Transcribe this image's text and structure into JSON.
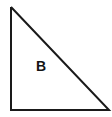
{
  "figure": {
    "kind": "geometry-figure",
    "shape_type": "right-triangle",
    "background_color": "#ffffff",
    "stroke_color": "#1a1a1a",
    "stroke_width": 2,
    "fill": "none",
    "canvas": {
      "width": 112,
      "height": 117
    },
    "label": {
      "text": "B",
      "x": 41,
      "y": 67,
      "color": "#141414",
      "bold": true,
      "font_size": 14
    },
    "vertices": [
      {
        "name": "top-left-apex",
        "x": 11,
        "y": 7
      },
      {
        "name": "bottom-left-right-angle",
        "x": 11,
        "y": 110
      },
      {
        "name": "bottom-right",
        "x": 109,
        "y": 110
      }
    ],
    "edges": [
      {
        "name": "vertical-leg",
        "from": "top-left-apex",
        "to": "bottom-left-right-angle"
      },
      {
        "name": "horizontal-leg",
        "from": "bottom-left-right-angle",
        "to": "bottom-right"
      },
      {
        "name": "hypotenuse",
        "from": "bottom-right",
        "to": "top-left-apex"
      }
    ],
    "polygon_points": "11,7 11,110 109,110 11,7"
  }
}
